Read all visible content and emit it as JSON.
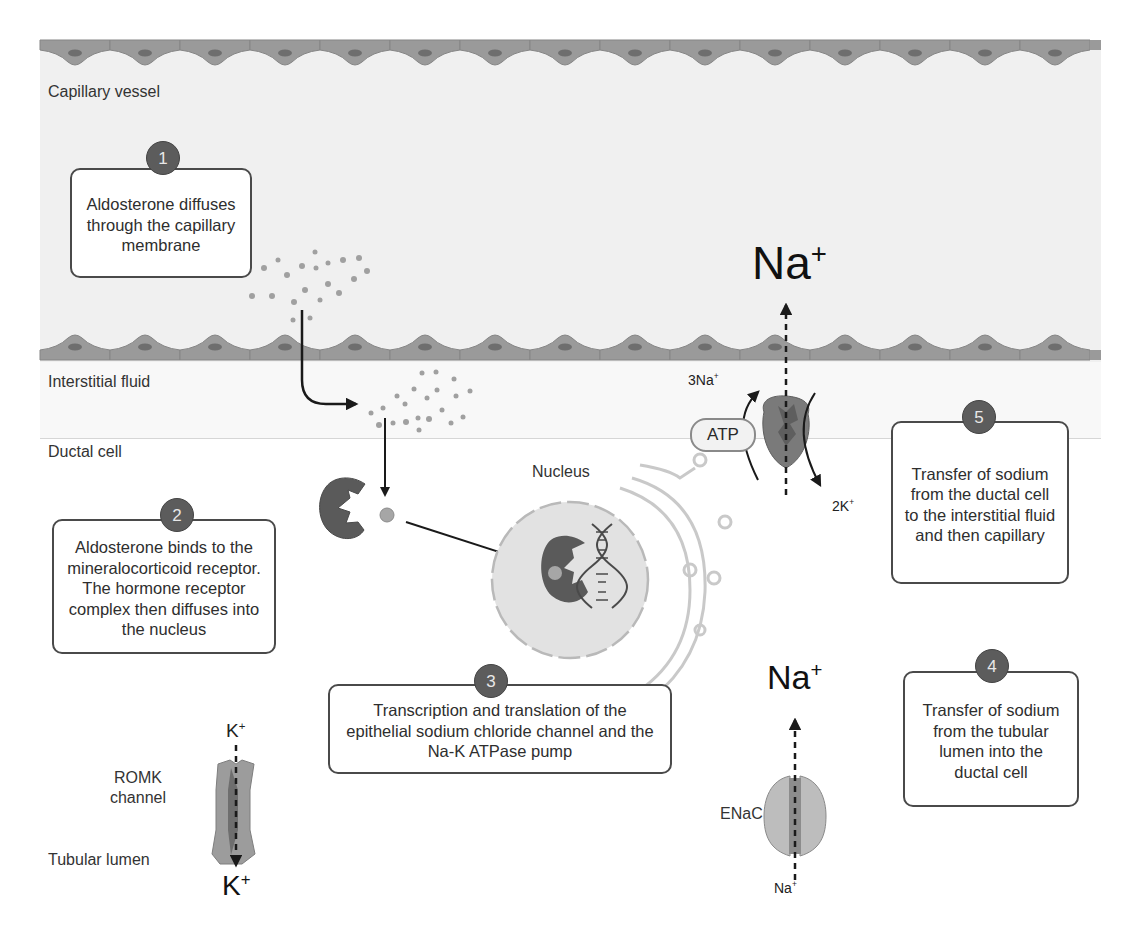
{
  "regions": {
    "capillary_vessel": "Capillary vessel",
    "interstitial_fluid": "Interstitial  fluid",
    "ductal_cell": "Ductal cell",
    "tubular_lumen": "Tubular lumen"
  },
  "structures": {
    "nucleus": "Nucleus",
    "romk_channel_line1": "ROMK",
    "romk_channel_line2": "channel",
    "enac": "ENaC",
    "atp": "ATP"
  },
  "ions": {
    "na_top": "Na",
    "na_top_charge": "+",
    "na_mid": "Na",
    "na_mid_charge": "+",
    "na_enac_bottom": "Na",
    "na_enac_bottom_charge": "+",
    "pump_3na": "3Na",
    "pump_3na_charge": "+",
    "pump_2k": "2K",
    "pump_2k_charge": "+",
    "k_top": "K",
    "k_top_charge": "+",
    "k_bottom": "K",
    "k_bottom_charge": "+"
  },
  "steps": [
    {
      "number": "1",
      "text": "Aldosterone diffuses through the capillary membrane"
    },
    {
      "number": "2",
      "text": "Aldosterone binds to the mineralocorticoid receptor. The hormone receptor complex then diffuses into the nucleus"
    },
    {
      "number": "3",
      "text": "Transcription and translation of the epithelial sodium chloride channel and the Na-K ATPase pump"
    },
    {
      "number": "4",
      "text": "Transfer of sodium from the tubular lumen into the ductal cell"
    },
    {
      "number": "5",
      "text": "Transfer of sodium from the ductal cell to the interstitial fluid and then capillary"
    }
  ],
  "colors": {
    "capillary_bg": "#f0f0f0",
    "endothelial_cell": "#9a9a9a",
    "endothelial_nucleus": "#6e6e6e",
    "badge": "#5c5c5c",
    "receptor": "#5a5a5a",
    "aldosterone_dot": "#a0a0a0",
    "nucleus_fill": "#e2e2e2",
    "channel": "#8c8c8c"
  }
}
